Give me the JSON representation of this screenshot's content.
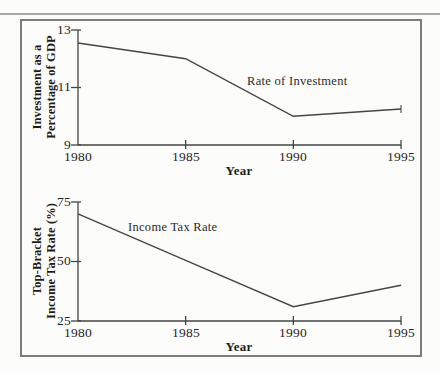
{
  "page": {
    "background": "#fcfcfa",
    "frame_color": "#7d7d7d",
    "top_rule_color": "#a8a8a8",
    "line_color": "#454545",
    "text_color": "#222222"
  },
  "chart_data": [
    {
      "type": "line",
      "title": "",
      "xlabel": "Year",
      "ylabel": "Investment as a Percentage of GDP",
      "ylabel_lines": [
        "Investment as a",
        "Percentage of GDP"
      ],
      "xlim": [
        1980,
        1995
      ],
      "ylim": [
        9,
        13
      ],
      "xticks": [
        "1980",
        "1985",
        "1990",
        "1995"
      ],
      "xtick_values": [
        1980,
        1985,
        1990,
        1995
      ],
      "yticks": [
        "13",
        "11",
        "9"
      ],
      "ytick_values": [
        13,
        11,
        9
      ],
      "grid": false,
      "legend": "inline-annotation",
      "annotation": "Rate of Investment",
      "end_tick": true,
      "line_color": "#454545",
      "series": [
        {
          "name": "Rate of Investment",
          "x": [
            1980,
            1985,
            1990,
            1995
          ],
          "y": [
            12.55,
            12.0,
            10.0,
            10.25
          ]
        }
      ]
    },
    {
      "type": "line",
      "title": "",
      "xlabel": "Year",
      "ylabel": "Top-Bracket Income Tax Rate (%)",
      "ylabel_lines": [
        "Top-Bracket",
        "Income Tax Rate (%)"
      ],
      "xlim": [
        1980,
        1995
      ],
      "ylim": [
        25,
        75
      ],
      "xticks": [
        "1980",
        "1985",
        "1990",
        "1995"
      ],
      "xtick_values": [
        1980,
        1985,
        1990,
        1995
      ],
      "yticks": [
        "75",
        "50",
        "25"
      ],
      "ytick_values": [
        75,
        50,
        25
      ],
      "grid": false,
      "legend": "inline-annotation",
      "annotation": "Income Tax Rate",
      "end_tick": false,
      "line_color": "#454545",
      "series": [
        {
          "name": "Income Tax Rate",
          "x": [
            1980,
            1985,
            1990,
            1995
          ],
          "y": [
            70,
            50.5,
            31,
            40
          ]
        }
      ]
    }
  ]
}
